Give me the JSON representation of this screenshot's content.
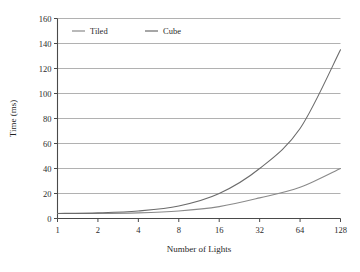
{
  "chart_data": {
    "type": "line",
    "title": "",
    "xlabel": "Number of Lights",
    "ylabel": "Time (ms)",
    "x": [
      1,
      2,
      4,
      8,
      16,
      32,
      64,
      128
    ],
    "xtick_labels": [
      "1",
      "2",
      "4",
      "8",
      "16",
      "32",
      "64",
      "128"
    ],
    "xscale": "log2",
    "ytick_labels": [
      "0",
      "20",
      "40",
      "60",
      "80",
      "100",
      "120",
      "140",
      "160"
    ],
    "yticks": [
      0,
      20,
      40,
      60,
      80,
      100,
      120,
      140,
      160
    ],
    "ylim": [
      0,
      160
    ],
    "grid": "horizontal",
    "legend_position": "top-left-inside",
    "series": [
      {
        "name": "Tiled",
        "color": "#8a8a8a",
        "values": [
          4,
          4,
          4.5,
          6,
          9.5,
          16.5,
          25,
          40
        ]
      },
      {
        "name": "Cube",
        "color": "#6b6b6b",
        "values": [
          4,
          4.5,
          6,
          10,
          20,
          40,
          72,
          135
        ]
      }
    ]
  },
  "axes": {
    "y_title": "Time (ms)",
    "x_title": "Number of Lights"
  },
  "legend": {
    "items": [
      {
        "label": "Tiled"
      },
      {
        "label": "Cube"
      }
    ]
  },
  "colors": {
    "grid": "#a8a8a8",
    "axis": "#4a4a4a",
    "tiled": "#8a8a8a",
    "cube": "#6b6b6b",
    "text": "#2b2b2b",
    "background": "#ffffff"
  }
}
